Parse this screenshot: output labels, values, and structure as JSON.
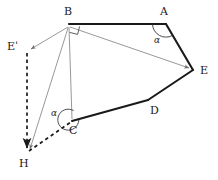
{
  "figure": {
    "type": "geometry-diagram",
    "background_color": "#ffffff",
    "stroke_color_thick": "#1a1a1a",
    "stroke_color_thin": "#7a7a7a",
    "stroke_color_dashed": "#1a1a1a",
    "canvas": {
      "width": 218,
      "height": 180
    },
    "vertices": [
      {
        "id": "B",
        "label": "B",
        "x": 69,
        "y": 24,
        "label_x": 64,
        "label_y": 8
      },
      {
        "id": "A",
        "label": "A",
        "x": 166,
        "y": 24,
        "label_x": 161,
        "label_y": 8
      },
      {
        "id": "E",
        "label": "E",
        "x": 193,
        "y": 70,
        "label_x": 200,
        "label_y": 65
      },
      {
        "id": "D",
        "label": "D",
        "x": 148,
        "y": 100,
        "label_x": 151,
        "label_y": 105
      },
      {
        "id": "C",
        "label": "C",
        "x": 72,
        "y": 121,
        "label_x": 70,
        "label_y": 127
      },
      {
        "id": "H",
        "label": "H",
        "x": 27,
        "y": 152,
        "label_x": 20,
        "label_y": 159
      },
      {
        "id": "Ep",
        "label": "Eˈ",
        "x": 27,
        "y": 50,
        "label_x": 9,
        "label_y": 41
      }
    ],
    "thick_path": [
      {
        "from": "B",
        "to": "A"
      },
      {
        "from": "A",
        "to": "E"
      },
      {
        "from": "E",
        "to": "D"
      },
      {
        "from": "D",
        "to": "C"
      }
    ],
    "thin_segments": [
      {
        "from": "B",
        "to": "E",
        "arrow_at_end": true
      },
      {
        "from": "B",
        "to": "Ep",
        "arrow_at_end": true
      },
      {
        "from": "B",
        "to": "H",
        "arrow_at_end": true
      },
      {
        "from": "B",
        "to": "C",
        "arrow_at_end": false
      }
    ],
    "dashed_segments": [
      {
        "from": "Ep",
        "to": "H",
        "arrow_at_end": true
      },
      {
        "from": "H",
        "to": "C",
        "arrow_at_end": false
      }
    ],
    "right_angle_marker": {
      "at": "B",
      "size": 8
    },
    "angle_marks": [
      {
        "id": "angle-at-a",
        "label": "α",
        "at": "A",
        "label_x": 155,
        "label_y": 37
      },
      {
        "id": "angle-at-c",
        "label": "α",
        "at": "C",
        "label_x": 52,
        "label_y": 110
      }
    ]
  }
}
